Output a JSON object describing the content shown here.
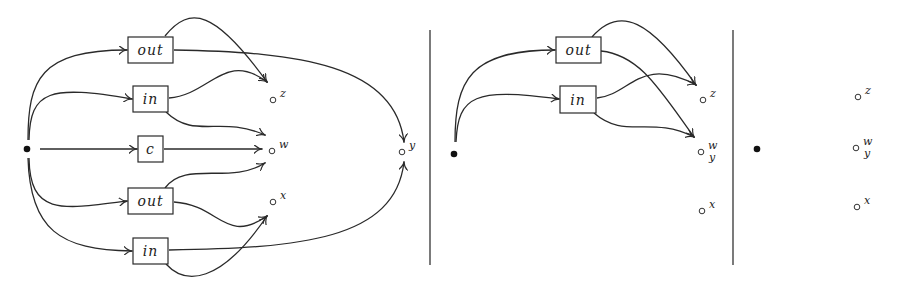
{
  "panels": [
    {
      "id": "panel-1",
      "source": "source-dot",
      "boxes": [
        {
          "id": "box-out-top",
          "label": "out"
        },
        {
          "id": "box-in-top",
          "label": "in"
        },
        {
          "id": "box-c",
          "label": "c"
        },
        {
          "id": "box-out-bottom",
          "label": "out"
        },
        {
          "id": "box-in-bottom",
          "label": "in"
        }
      ],
      "nodes": [
        {
          "id": "node-z",
          "label": "z"
        },
        {
          "id": "node-w",
          "label": "w"
        },
        {
          "id": "node-x",
          "label": "x"
        },
        {
          "id": "node-y",
          "label": "y"
        }
      ],
      "edges": [
        {
          "from": "source",
          "to": "box-out-top"
        },
        {
          "from": "source",
          "to": "box-in-top"
        },
        {
          "from": "source",
          "to": "box-c"
        },
        {
          "from": "source",
          "to": "box-out-bottom"
        },
        {
          "from": "source",
          "to": "box-in-bottom"
        },
        {
          "from": "box-out-top",
          "to": "node-z"
        },
        {
          "from": "box-out-top",
          "to": "node-y"
        },
        {
          "from": "box-in-top",
          "to": "node-z"
        },
        {
          "from": "box-in-top",
          "to": "node-w"
        },
        {
          "from": "box-c",
          "to": "node-w"
        },
        {
          "from": "box-out-bottom",
          "to": "node-w"
        },
        {
          "from": "box-out-bottom",
          "to": "node-x"
        },
        {
          "from": "box-in-bottom",
          "to": "node-x"
        },
        {
          "from": "box-in-bottom",
          "to": "node-y"
        }
      ]
    },
    {
      "id": "panel-2",
      "source": "source-dot",
      "boxes": [
        {
          "id": "box-out",
          "label": "out"
        },
        {
          "id": "box-in",
          "label": "in"
        }
      ],
      "nodes": [
        {
          "id": "node-z",
          "label": "z"
        },
        {
          "id": "node-wy",
          "label_top": "w",
          "label_bottom": "y"
        },
        {
          "id": "node-x",
          "label": "x"
        }
      ],
      "edges": [
        {
          "from": "source",
          "to": "box-out"
        },
        {
          "from": "source",
          "to": "box-in"
        },
        {
          "from": "box-out",
          "to": "node-z"
        },
        {
          "from": "box-out",
          "to": "node-wy"
        },
        {
          "from": "box-in",
          "to": "node-z"
        },
        {
          "from": "box-in",
          "to": "node-wy"
        }
      ]
    },
    {
      "id": "panel-3",
      "source": "source-dot",
      "nodes": [
        {
          "id": "node-z",
          "label": "z"
        },
        {
          "id": "node-wy",
          "label_top": "w",
          "label_bottom": "y"
        },
        {
          "id": "node-x",
          "label": "x"
        }
      ]
    }
  ]
}
